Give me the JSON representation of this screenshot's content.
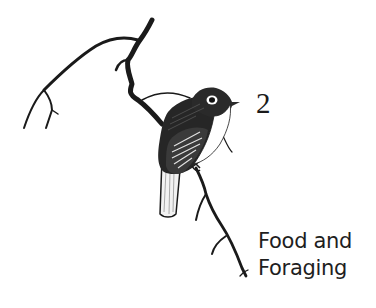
{
  "chapter": {
    "number": "2",
    "title_lines": [
      "Food and",
      "Foraging"
    ]
  },
  "illustration": {
    "subject": "songbird-perched-on-branch",
    "ink_color": "#1a1a1a",
    "paper_color": "#ffffff"
  }
}
